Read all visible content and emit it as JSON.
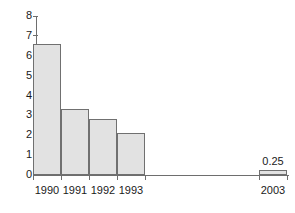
{
  "chart_data": {
    "type": "bar",
    "title": "",
    "subtitle": "",
    "xlabel": "",
    "ylabel": "",
    "categories": [
      "1990",
      "1991",
      "1992",
      "1993",
      "2003"
    ],
    "values": [
      6.6,
      3.3,
      2.8,
      2.1,
      0.25
    ],
    "point_labels": [
      "",
      "",
      "",
      "",
      "0.25"
    ],
    "ylim": [
      0,
      8
    ],
    "y_ticks": [
      0,
      1,
      2,
      3,
      4,
      5,
      6,
      7,
      8
    ],
    "y_tick_labels": [
      "0",
      "1",
      "2",
      "3",
      "4",
      "5",
      "6",
      "7",
      "8"
    ],
    "grid": false,
    "legend": false,
    "legend_position": "none",
    "bar_fill_color": "#e2e2e2",
    "bar_border_color": "#707070",
    "axis_color": "#6e6e6e",
    "text_color": "#1a1a1a",
    "background_color": "#ffffff",
    "note": "Last category is separated by a large gap along the x-axis"
  },
  "layout": {
    "plot_left": 36,
    "plot_top": 16,
    "plot_bottom": 175,
    "plot_right": 289,
    "bars": [
      {
        "x": 33,
        "width": 28
      },
      {
        "x": 61,
        "width": 28
      },
      {
        "x": 89,
        "width": 28
      },
      {
        "x": 117,
        "width": 28
      },
      {
        "x": 259,
        "width": 28
      }
    ]
  }
}
